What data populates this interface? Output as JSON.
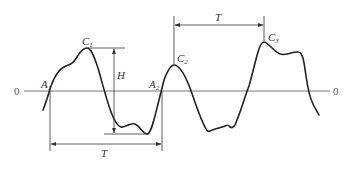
{
  "diagram": {
    "type": "waveform-measurement",
    "colors": {
      "wave": "#222222",
      "axis": "#666666",
      "dimension": "#333333",
      "text": "#333333"
    },
    "axis": {
      "left_label": "0",
      "right_label": "0"
    },
    "points": {
      "A1": {
        "letter": "A",
        "sub": "1"
      },
      "A2": {
        "letter": "A",
        "sub": "2"
      },
      "C1": {
        "letter": "C",
        "sub": "1"
      },
      "C2": {
        "letter": "C",
        "sub": "2"
      },
      "C3": {
        "letter": "C",
        "sub": "3"
      }
    },
    "dimensions": {
      "height_label": "H",
      "period_bottom_label": "T",
      "period_top_label": "T"
    }
  }
}
